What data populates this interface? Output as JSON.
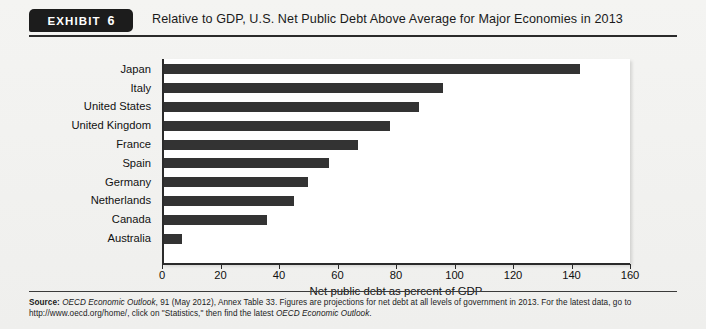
{
  "header": {
    "badge_word": "EXHIBIT",
    "badge_number": "6",
    "title": "Relative to GDP, U.S. Net Public Debt Above Average for Major Economies in 2013"
  },
  "footer": {
    "source_label": "Source:",
    "source_italic_1": "OECD Economic Outlook",
    "source_text_1": ", 91 (May 2012), Annex Table 33. Figures are projections for net debt at all levels of government in 2013. For the latest data, go to http://www.oecd.org/home/, click on \"Statistics,\" then find the latest ",
    "source_italic_2": "OECD Economic Outlook",
    "source_text_2": "."
  },
  "chart_data": {
    "type": "bar",
    "orientation": "horizontal",
    "title": "Relative to GDP, U.S. Net Public Debt Above Average for Major Economies in 2013",
    "xlabel": "Net public debt as percent of GDP",
    "ylabel": "",
    "categories": [
      "Japan",
      "Italy",
      "United States",
      "United Kingdom",
      "France",
      "Spain",
      "Germany",
      "Netherlands",
      "Canada",
      "Australia"
    ],
    "values": [
      143,
      96,
      88,
      78,
      67,
      57,
      50,
      45,
      36,
      7
    ],
    "xlim": [
      0,
      160
    ],
    "xticks": [
      0,
      20,
      40,
      60,
      80,
      100,
      120,
      140,
      160
    ],
    "grid": false,
    "legend": false,
    "bar_color": "#333333",
    "plot_background": "#ffffff"
  }
}
